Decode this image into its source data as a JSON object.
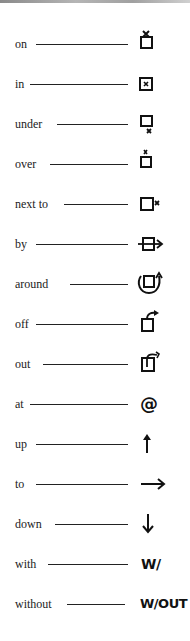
{
  "items": [
    {
      "word": "on",
      "symbol": "box-with-x-on-top-icon"
    },
    {
      "word": "in",
      "symbol": "box-with-x-inside-icon"
    },
    {
      "word": "under",
      "symbol": "box-with-x-below-icon"
    },
    {
      "word": "over",
      "symbol": "box-with-x-above-icon"
    },
    {
      "word": "next to",
      "symbol": "box-with-x-beside-icon"
    },
    {
      "word": "by",
      "symbol": "arrow-passing-box-icon"
    },
    {
      "word": "around",
      "symbol": "circular-arrow-around-box-icon"
    },
    {
      "word": "off",
      "symbol": "arrow-off-box-icon"
    },
    {
      "word": "out",
      "symbol": "arrow-out-of-box-icon"
    },
    {
      "word": "at",
      "symbol": "at-sign-icon",
      "text": "@"
    },
    {
      "word": "up",
      "symbol": "up-arrow-icon"
    },
    {
      "word": "to",
      "symbol": "right-arrow-icon"
    },
    {
      "word": "down",
      "symbol": "down-arrow-icon"
    },
    {
      "word": "with",
      "symbol": "with-abbreviation",
      "text": "W/"
    },
    {
      "word": "without",
      "symbol": "without-abbreviation",
      "text": "W/OUT"
    }
  ]
}
